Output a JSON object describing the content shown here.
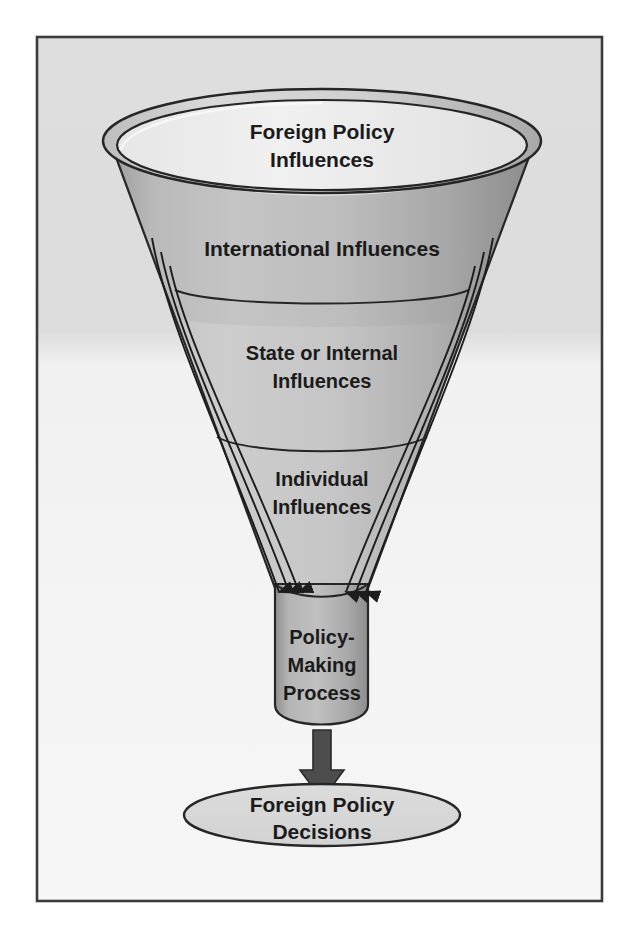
{
  "figure": {
    "type": "funnel-diagram",
    "frame": {
      "border_color": "#3a3a3a",
      "background_top": "#dcdcdc",
      "background_bottom": "#f4f4f4"
    },
    "colors": {
      "outline": "#2a2a2a",
      "text": "#1b1b1b",
      "funnel_light": "#d2d2d2",
      "funnel_mid": "#b6b6b6",
      "funnel_dark": "#8e8e8e",
      "rim_light": "#e8e8e8",
      "neck_fill": "#b0b0b0",
      "ellipse_fill": "#d8d8d8",
      "arrow_fill": "#4a4a4a"
    }
  },
  "funnel": {
    "rim_label": {
      "line1": "Foreign Policy",
      "line2": "Influences"
    },
    "sections": [
      {
        "id": "international",
        "label_line1": "International Influences",
        "label_line2": "",
        "order": 1
      },
      {
        "id": "state-internal",
        "label_line1": "State or Internal",
        "label_line2": "Influences",
        "order": 2
      },
      {
        "id": "individual",
        "label_line1": "Individual",
        "label_line2": "Influences",
        "order": 3
      }
    ],
    "neck": {
      "label_line1": "Policy-",
      "label_line2": "Making",
      "label_line3": "Process"
    },
    "flow_arrows": {
      "count_per_side": 3,
      "sides": 2,
      "direction": "down"
    },
    "output_arrow": {
      "direction": "down"
    },
    "outcome": {
      "label_line1": "Foreign Policy",
      "label_line2": "Decisions"
    }
  }
}
